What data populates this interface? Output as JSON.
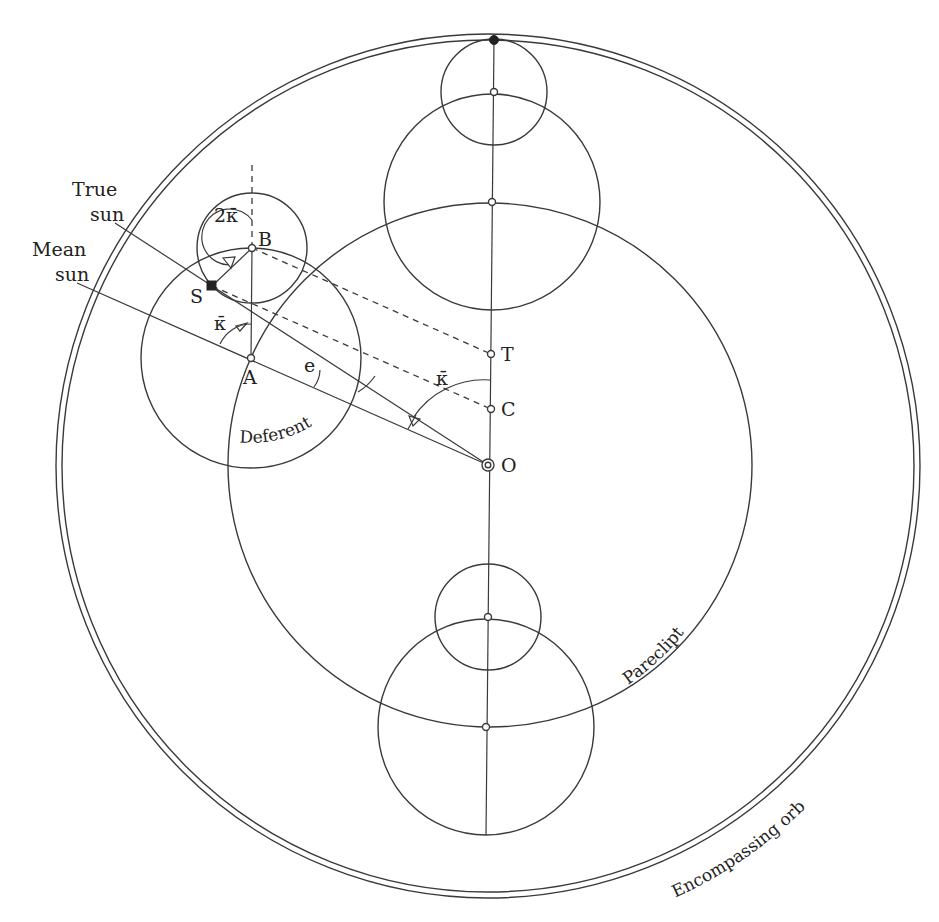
{
  "diagram": {
    "title": "",
    "labels": {
      "true_sun": [
        "True",
        "sun"
      ],
      "mean_sun": [
        "Mean",
        "sun"
      ],
      "point_b": "B",
      "point_s": "S",
      "point_a": "A",
      "point_t": "T",
      "point_c": "C",
      "point_o": "O",
      "angle_2kappa": "2κ̄",
      "angle_kappa_epicycle": "κ̄",
      "angle_kappa_center": "κ̄",
      "angle_e": "e",
      "deferent": "Deferent",
      "pareclipt": "Pareclipt",
      "encompassing_orb": "Encompassing orb"
    },
    "circles": {
      "encompassing_orb": {
        "cx": 488,
        "cy": 466,
        "r": 430
      },
      "pareclipt": {
        "cx": 490,
        "cy": 465,
        "r": 262
      },
      "deferent": {
        "cx": 251,
        "cy": 358,
        "r": 110
      },
      "epicycle": {
        "cx": 252,
        "cy": 249,
        "r": 55
      },
      "top_small": {
        "cx": 494,
        "cy": 92,
        "r": 53
      },
      "top_large": {
        "cx": 492,
        "cy": 202,
        "r": 108
      },
      "bottom_small": {
        "cx": 488,
        "cy": 617,
        "r": 53
      },
      "bottom_large": {
        "cx": 486,
        "cy": 727,
        "r": 108
      }
    },
    "points": {
      "O": [
        488,
        465
      ],
      "A": [
        251,
        358
      ],
      "B": [
        252,
        249
      ],
      "S": [
        212,
        286
      ],
      "T": [
        491,
        354
      ],
      "C": [
        491,
        409
      ]
    }
  }
}
